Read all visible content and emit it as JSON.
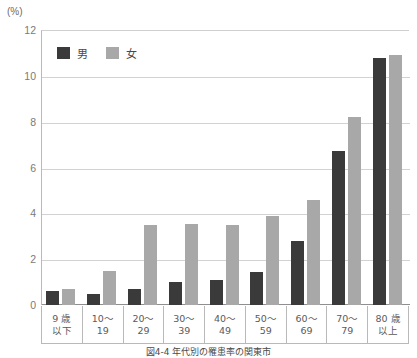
{
  "unit_label": "(%)",
  "caption": "図4-4  年代別の罹患率の関東市",
  "colors": {
    "male_bar": "#3a3a3a",
    "female_bar": "#a8a8a8",
    "gridline": "#d2d2d2",
    "axis": "#b9b9b9",
    "tick_text": "#7a7a7a"
  },
  "legend": {
    "position": "top-left-inside",
    "items": [
      {
        "label": "男",
        "color": "#3a3a3a",
        "swatch_name": "male-swatch"
      },
      {
        "label": "女",
        "color": "#a8a8a8",
        "swatch_name": "female-swatch"
      }
    ]
  },
  "yaxis": {
    "ticks": [
      "0",
      "2",
      "4",
      "6",
      "8",
      "10",
      "12"
    ],
    "min": 0,
    "max": 12,
    "step": 2
  },
  "xaxis": {
    "categories": [
      {
        "line1": "9 歳",
        "line2": "以下"
      },
      {
        "line1": "10〜",
        "line2": "19"
      },
      {
        "line1": "20〜",
        "line2": "29"
      },
      {
        "line1": "30〜",
        "line2": "39"
      },
      {
        "line1": "40〜",
        "line2": "49"
      },
      {
        "line1": "50〜",
        "line2": "59"
      },
      {
        "line1": "60〜",
        "line2": "69"
      },
      {
        "line1": "70〜",
        "line2": "79"
      },
      {
        "line1": "80 歳",
        "line2": "以上"
      }
    ]
  },
  "chart_data": {
    "type": "bar",
    "title": "図4-4  年代別の罹患率の関東市",
    "xlabel": "",
    "ylabel": "(%)",
    "ylim": [
      0,
      12
    ],
    "ystep": 2,
    "grid": true,
    "legend_position": "upper left",
    "categories": [
      "9歳以下",
      "10〜19",
      "20〜29",
      "30〜39",
      "40〜49",
      "50〜59",
      "60〜69",
      "70〜79",
      "80歳以上"
    ],
    "series": [
      {
        "name": "男",
        "color": "#3a3a3a",
        "values": [
          0.6,
          0.5,
          0.7,
          1.0,
          1.1,
          1.45,
          2.8,
          6.7,
          10.8
        ]
      },
      {
        "name": "女",
        "color": "#a8a8a8",
        "values": [
          0.7,
          1.5,
          3.5,
          3.55,
          3.5,
          3.9,
          4.6,
          8.2,
          10.9
        ]
      }
    ]
  }
}
